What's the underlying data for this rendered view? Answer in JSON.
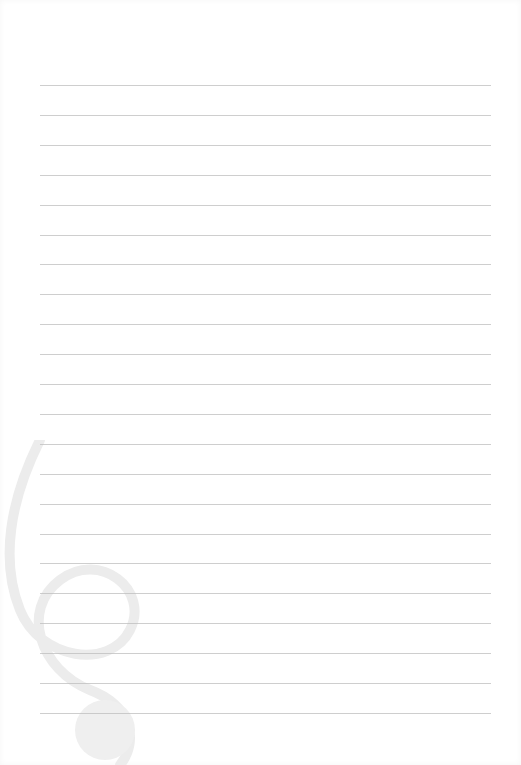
{
  "page": {
    "type": "lined-paper",
    "background": "#ffffff",
    "line_color": "#bdbdbd",
    "line_count": 22,
    "first_line_y": 85,
    "line_spacing": 29.9,
    "line_left": 40,
    "line_width": 451,
    "watermark": {
      "icon": "treble-clef-icon",
      "color": "#ececec"
    }
  }
}
